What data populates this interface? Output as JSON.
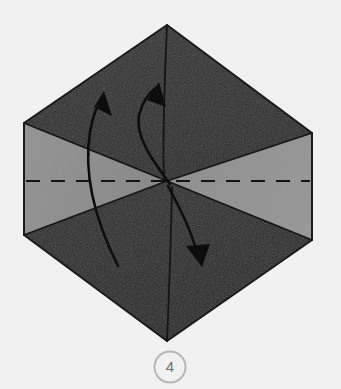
{
  "figure": {
    "name": "origami-fold-step-diagram",
    "step_number": "4",
    "background_color": "#f1f1f1"
  },
  "colors": {
    "paper_dark": "#2b2b2b",
    "paper_dark_shade": "#333333",
    "paper_dark_shade_2": "#272727",
    "paper_gray": "#8a8a8a",
    "paper_gray_shade": "#949494",
    "outline": "#1a1a1a",
    "crease": "#111111",
    "arrow": "#0d0d0d",
    "badge_ring": "#b6b6b6",
    "badge_fill": "#f1f1f1",
    "badge_text": "#6f6f6f",
    "background": "#f1f1f1"
  },
  "shape": {
    "type": "hexagon",
    "description": "Flat-sided hexagon with vertical left and right edges, pointed top and bottom vertices",
    "vertices": [
      {
        "name": "top",
        "x": 167,
        "y": 25
      },
      {
        "name": "upper-right",
        "x": 312,
        "y": 133
      },
      {
        "name": "lower-right",
        "x": 312,
        "y": 240
      },
      {
        "name": "bottom",
        "x": 167,
        "y": 341
      },
      {
        "name": "lower-left",
        "x": 24,
        "y": 235
      },
      {
        "name": "upper-left",
        "x": 24,
        "y": 123
      }
    ],
    "center": {
      "x": 167,
      "y": 181
    }
  },
  "regions": [
    {
      "name": "upper-dark-region",
      "color_key": "paper_dark",
      "points": "167,25 312,133 167,181 24,123"
    },
    {
      "name": "lower-dark-region",
      "color_key": "paper_dark",
      "points": "24,235 167,181 312,240 167,341"
    },
    {
      "name": "left-gray-triangle",
      "color_key": "paper_gray",
      "points": "24,123 167,181 24,235"
    },
    {
      "name": "right-gray-triangle",
      "color_key": "paper_gray",
      "points": "312,133 312,240 167,181"
    }
  ],
  "fold_line": {
    "name": "horizontal-valley-fold-dashed-line",
    "style": "dashed",
    "y": 181,
    "x_start": 26,
    "x_end": 310,
    "dash_length": 14,
    "gap_length": 11,
    "stroke_width": 2
  },
  "creases": [
    {
      "name": "crease-top-vertex-to-center",
      "d": "M 167,25 L 163,175"
    },
    {
      "name": "crease-center-to-bottom-vertex",
      "d": "M 172,188 L 167,341"
    },
    {
      "name": "crease-upper-left-diagonal",
      "d": "M 24,123 L 167,181"
    },
    {
      "name": "crease-upper-right-diagonal",
      "d": "M 312,133 L 167,181"
    },
    {
      "name": "crease-lower-left-diagonal",
      "d": "M 24,235 L 167,181"
    },
    {
      "name": "crease-lower-right-diagonal",
      "d": "M 312,240 L 167,181"
    }
  ],
  "arrows": [
    {
      "name": "left-curved-fold-arrow-up",
      "direction": "up",
      "path": "M 118,266 C 100,230 82,180 90,130 C 93,113 98,102 102,96",
      "head": "100,92 112,112 96,108",
      "head_rotation": -18
    },
    {
      "name": "middle-curved-fold-arrow-up",
      "direction": "up",
      "path": "M 170,184 C 152,160 136,134 140,114 C 144,100 151,92 156,87",
      "head": "157,83 166,104 148,101",
      "head_rotation": -22
    },
    {
      "name": "right-curved-fold-arrow-down",
      "direction": "down",
      "path": "M 168,186 C 178,206 190,228 196,248 C 197,252 198,256 199,259",
      "head": "201,265 188,246 212,245",
      "head_rotation": 12
    }
  ],
  "badge": {
    "name": "step-number-badge",
    "label": "4",
    "cx": 170,
    "cy": 367,
    "r": 16
  }
}
